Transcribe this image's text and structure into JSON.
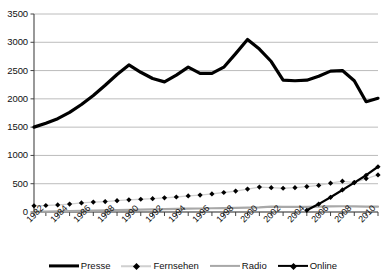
{
  "chart_data": {
    "type": "line",
    "title": "",
    "xlabel": "",
    "ylabel": "",
    "xlim": [
      1982,
      2011
    ],
    "ylim": [
      0,
      3500
    ],
    "ytick_values": [
      0,
      500,
      1000,
      1500,
      2000,
      2500,
      3000,
      3500
    ],
    "ytick_labels": [
      "0",
      "500",
      "1000",
      "1500",
      "2000",
      "2500",
      "3000",
      "3500"
    ],
    "xtick_values": [
      1982,
      1984,
      1986,
      1988,
      1990,
      1992,
      1994,
      1996,
      1998,
      2000,
      2002,
      2004,
      2006,
      2008,
      2010
    ],
    "xtick_labels": [
      "1982",
      "1984",
      "1986",
      "1988",
      "1990",
      "1992",
      "1994",
      "1996",
      "1998",
      "2000",
      "2002",
      "2004",
      "2006",
      "2008",
      "2010"
    ],
    "grid": true,
    "grid_axis": "y",
    "legend_position": "bottom",
    "x": [
      1982,
      1983,
      1984,
      1985,
      1986,
      1987,
      1988,
      1989,
      1990,
      1991,
      1992,
      1993,
      1994,
      1995,
      1996,
      1997,
      1998,
      1999,
      2000,
      2001,
      2002,
      2003,
      2004,
      2005,
      2006,
      2007,
      2008,
      2009,
      2010,
      2011
    ],
    "series": [
      {
        "name": "Presse",
        "color": "#000000",
        "width": 3.2,
        "marker": "none",
        "values": [
          1500,
          1570,
          1650,
          1760,
          1900,
          2060,
          2240,
          2430,
          2600,
          2470,
          2360,
          2300,
          2420,
          2560,
          2450,
          2450,
          2560,
          2800,
          3050,
          2880,
          2660,
          2330,
          2320,
          2330,
          2400,
          2490,
          2500,
          2320,
          1950,
          2010
        ]
      },
      {
        "name": "Fernsehen",
        "color": "#d0d0d0",
        "width": 1.3,
        "marker": "diamond",
        "marker_color": "#000000",
        "values": [
          110,
          115,
          125,
          140,
          160,
          175,
          185,
          200,
          215,
          225,
          235,
          250,
          265,
          285,
          300,
          320,
          345,
          370,
          405,
          440,
          430,
          420,
          430,
          450,
          470,
          510,
          545,
          520,
          590,
          655
        ]
      },
      {
        "name": "Radio",
        "color": "#a8a8a8",
        "width": 2.2,
        "marker": "none",
        "values": [
          5,
          8,
          12,
          16,
          20,
          25,
          30,
          34,
          38,
          42,
          46,
          50,
          54,
          58,
          62,
          66,
          70,
          74,
          78,
          82,
          96,
          92,
          90,
          92,
          96,
          100,
          102,
          100,
          96,
          94
        ]
      },
      {
        "name": "Online",
        "color": "#000000",
        "width": 2.2,
        "marker": "diamond",
        "marker_color": "#000000",
        "values": [
          null,
          null,
          null,
          null,
          null,
          null,
          null,
          null,
          null,
          null,
          null,
          null,
          null,
          null,
          null,
          null,
          null,
          null,
          null,
          null,
          null,
          null,
          null,
          30,
          140,
          260,
          390,
          520,
          650,
          800
        ]
      }
    ]
  },
  "legend": {
    "entries": [
      {
        "label": "Presse"
      },
      {
        "label": "Fernsehen"
      },
      {
        "label": "Radio"
      },
      {
        "label": "Online"
      }
    ]
  }
}
